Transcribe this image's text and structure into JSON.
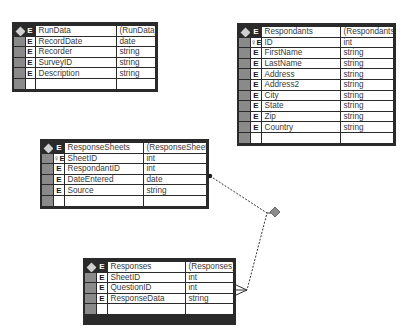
{
  "entities": {
    "rundata": {
      "name": "RunData",
      "physical": "(RunData)",
      "marker": "E",
      "fields": [
        {
          "marker": "E",
          "name": "RecordDate",
          "type": "date"
        },
        {
          "marker": "E",
          "name": "Recorder",
          "type": "string"
        },
        {
          "marker": "E",
          "name": "SurveyID",
          "type": "string"
        },
        {
          "marker": "E",
          "name": "Description",
          "type": "string"
        }
      ]
    },
    "respondants": {
      "name": "Respondants",
      "physical": "(Respondants)",
      "marker": "E",
      "fields": [
        {
          "marker": "E",
          "key": true,
          "name": "ID",
          "type": "int"
        },
        {
          "marker": "E",
          "name": "FirstName",
          "type": "string"
        },
        {
          "marker": "E",
          "name": "LastName",
          "type": "string"
        },
        {
          "marker": "E",
          "name": "Address",
          "type": "string"
        },
        {
          "marker": "E",
          "name": "Address2",
          "type": "string"
        },
        {
          "marker": "E",
          "name": "City",
          "type": "string"
        },
        {
          "marker": "E",
          "name": "State",
          "type": "string"
        },
        {
          "marker": "E",
          "name": "Zip",
          "type": "string"
        },
        {
          "marker": "E",
          "name": "Country",
          "type": "string"
        }
      ]
    },
    "responsesheets": {
      "name": "ResponseSheets",
      "physical": "(ResponseSheet)",
      "marker": "E",
      "fields": [
        {
          "marker": "E",
          "key": true,
          "name": "SheetID",
          "type": "int"
        },
        {
          "marker": "E",
          "name": "RespondantID",
          "type": "int"
        },
        {
          "marker": "E",
          "name": "DateEntered",
          "type": "date"
        },
        {
          "marker": "E",
          "name": "Source",
          "type": "string"
        }
      ]
    },
    "responses": {
      "name": "Responses",
      "physical": "(Responses)",
      "marker": "E",
      "fields": [
        {
          "marker": "E",
          "name": "SheetID",
          "type": "int"
        },
        {
          "marker": "E",
          "name": "QuestionID",
          "type": "int"
        },
        {
          "marker": "E",
          "name": "ResponseData",
          "type": "string"
        }
      ]
    }
  },
  "relationships": [
    {
      "from": "ResponseSheets",
      "to": "Responses",
      "from_end": "one (dot)",
      "to_end": "many (crow's foot)",
      "style": "dashed",
      "connector": "diamond"
    }
  ],
  "colors": {
    "frame": "#2a2a2a",
    "gutter": "#8a8a8a",
    "text": "#3a3a3a",
    "diamond": "#8c8c8c"
  }
}
